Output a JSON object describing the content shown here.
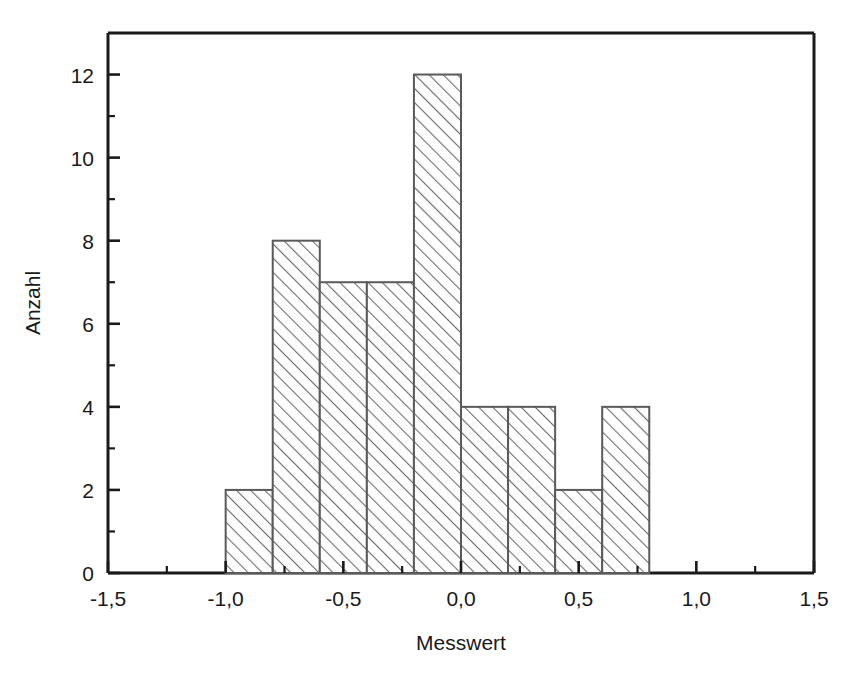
{
  "chart_data": {
    "type": "bar",
    "title": "",
    "subtitle": "",
    "xlabel": "Messwert",
    "ylabel": "Anzahl",
    "xlim": [
      -1.5,
      1.5
    ],
    "ylim": [
      0,
      13
    ],
    "grid": false,
    "legend": null,
    "bin_width": 0.2,
    "bin_edges": [
      -1.0,
      -0.8,
      -0.6,
      -0.4,
      -0.2,
      0.0,
      0.2,
      0.4,
      0.6,
      0.8
    ],
    "categories": [
      "-1,0 – -0,8",
      "-0,8 – -0,6",
      "-0,6 – -0,4",
      "-0,4 – -0,2",
      "-0,2 – 0,0",
      "0,0 – 0,2",
      "0,2 – 0,4",
      "0,4 – 0,6",
      "0,6 – 0,8"
    ],
    "values": [
      2,
      8,
      7,
      7,
      12,
      4,
      4,
      2,
      4
    ],
    "x_major_ticks": [
      -1.5,
      -1.0,
      -0.5,
      0.0,
      0.5,
      1.0,
      1.5
    ],
    "x_major_tick_labels": [
      "-1,5",
      "-1,0",
      "-0,5",
      "0,0",
      "0,5",
      "1,0",
      "1,5"
    ],
    "x_minor_ticks": [
      -1.25,
      -0.75,
      -0.25,
      0.25,
      0.75,
      1.25
    ],
    "y_major_ticks": [
      0,
      2,
      4,
      6,
      8,
      10,
      12
    ],
    "y_major_tick_labels": [
      "0",
      "2",
      "4",
      "6",
      "8",
      "10",
      "12"
    ],
    "y_minor_ticks": [
      1,
      3,
      5,
      7,
      9,
      11
    ],
    "total_count": 50,
    "colors": {
      "axis": "#1a1a1a",
      "bar_edge": "#5a5a5a",
      "bar_hatch": "#6e6e6e",
      "bar_fill": "#ffffff",
      "background": "#ffffff"
    }
  }
}
